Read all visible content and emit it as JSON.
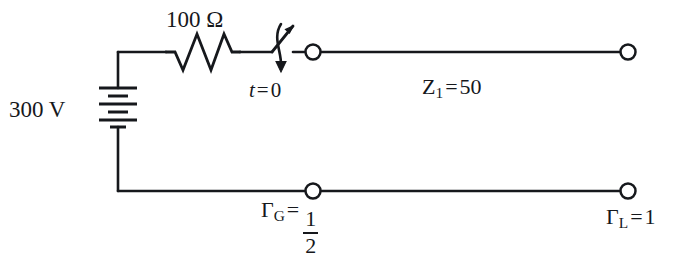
{
  "figure": {
    "kind": "circuit-schematic",
    "ink_color": "#16181c",
    "background_color": "#ffffff"
  },
  "labels": {
    "resistor": "100 Ω",
    "source": "300 V",
    "switch_time_var": "t",
    "switch_time_eq": "=",
    "switch_time_val": "0",
    "line_impedance_sym": "Z",
    "line_impedance_sub": "1",
    "line_impedance_eq": "=",
    "line_impedance_val": "50",
    "gamma_g_sym": "Γ",
    "gamma_g_sub": "G",
    "gamma_g_eq": "=",
    "gamma_g_num": "1",
    "gamma_g_den": "2",
    "gamma_l_sym": "Γ",
    "gamma_l_sub": "L",
    "gamma_l_eq": "=",
    "gamma_l_val": "1"
  },
  "components": {
    "battery": {
      "name": "dc-voltage-source",
      "value": "300 V",
      "plate_count": 6
    },
    "resistor": {
      "name": "series-resistor",
      "value": "100 Ω",
      "zigzag_peaks": 4
    },
    "switch": {
      "name": "closing-switch",
      "annotation": "t = 0",
      "state": "open"
    },
    "transmission_line": {
      "name": "transmission-line",
      "characteristic_impedance": "50",
      "source_reflection_coefficient": "1/2",
      "load_reflection_coefficient": "1"
    },
    "terminals": [
      {
        "name": "terminal-upper-left",
        "x": 313,
        "y": 52
      },
      {
        "name": "terminal-upper-right",
        "x": 628,
        "y": 52
      },
      {
        "name": "terminal-lower-left",
        "x": 313,
        "y": 191
      },
      {
        "name": "terminal-lower-right",
        "x": 628,
        "y": 191
      }
    ]
  }
}
